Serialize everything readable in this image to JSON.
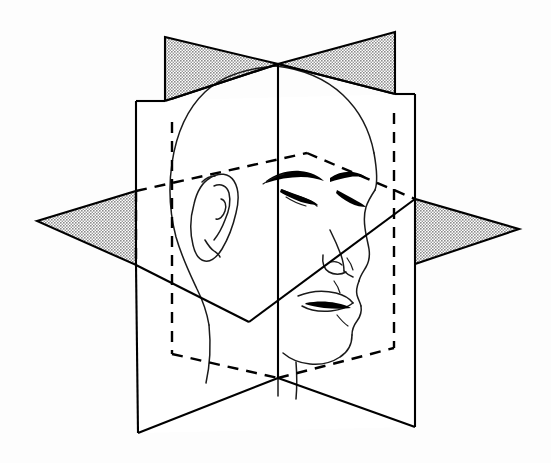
{
  "figure": {
    "background_color": "#fdfdfd",
    "line_color": "#000000",
    "shade_color": "#b0b0b0",
    "face_line_color": "#1a1a1a"
  },
  "planes": [
    {
      "id": "sagittal",
      "name": "median sagittal plane",
      "orientation": "vertical, front-to-back",
      "fill": "#ffffff",
      "shaded_wings": true,
      "wing_fill": "#b0b0b0",
      "outline": "278,64 165,37 165,37 278,64"
    },
    {
      "id": "coronal",
      "name": "coronal plane",
      "orientation": "vertical, left-to-right",
      "fill": "#ffffff",
      "shaded_wings": false
    },
    {
      "id": "transverse",
      "name": "transverse plane",
      "orientation": "horizontal",
      "fill": "#ffffff",
      "shaded_wings": true,
      "wing_fill": "#b0b0b0"
    }
  ],
  "features": [
    {
      "name": "head-outline",
      "visible": true
    },
    {
      "name": "ear",
      "visible": true,
      "side": "left"
    },
    {
      "name": "eye-near",
      "visible": true,
      "state": "closed"
    },
    {
      "name": "eye-far",
      "visible": true,
      "state": "closed"
    },
    {
      "name": "eyebrow-near",
      "visible": true
    },
    {
      "name": "eyebrow-far",
      "visible": true
    },
    {
      "name": "nose",
      "visible": true
    },
    {
      "name": "lips",
      "visible": true
    },
    {
      "name": "chin",
      "visible": true
    },
    {
      "name": "neck",
      "visible": true
    }
  ],
  "geometry": {
    "center_top_vertex": [
      278,
      64
    ],
    "center_bottom_vertex": [
      278,
      378
    ],
    "sagittal_wing_top_left": [
      165,
      37
    ],
    "sagittal_wing_top_right": [
      395,
      32
    ],
    "coronal_top_left": [
      136,
      101
    ],
    "coronal_top_right": [
      415,
      94
    ],
    "coronal_bottom_left": [
      138,
      433
    ],
    "coronal_bottom_right": [
      415,
      427
    ],
    "transverse_left_tip": [
      37,
      221
    ],
    "transverse_right_tip": [
      519,
      229
    ],
    "transverse_near_corner": [
      249,
      322
    ],
    "transverse_far_corner": [
      307,
      153
    ]
  },
  "line_styles": {
    "solid_width": 2.1,
    "dashed_width": 2.4,
    "dash_pattern": "11 8",
    "face_width": 1.5
  }
}
